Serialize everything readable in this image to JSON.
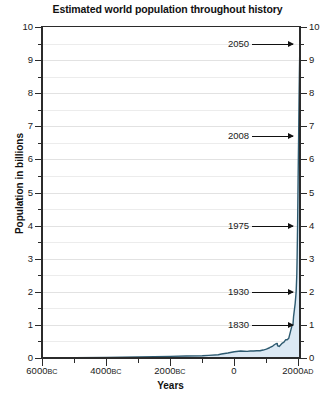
{
  "chart_data": {
    "type": "area",
    "title": "Estimated world population throughout history",
    "xlabel": "Years",
    "ylabel": "Population in billions",
    "xlim": [
      -6000,
      2050
    ],
    "ylim": [
      0,
      10
    ],
    "grid": true,
    "legend": "none",
    "y_ticks_major": [
      0,
      1,
      2,
      3,
      4,
      5,
      6,
      7,
      8,
      9,
      10
    ],
    "y_ticks_minor": [
      0.5,
      1.5,
      2.5,
      3.5,
      4.5,
      5.5,
      6.5,
      7.5,
      8.5,
      9.5
    ],
    "y_tick_labels": [
      "0",
      "1",
      "2",
      "3",
      "4",
      "5",
      "6",
      "7",
      "8",
      "9",
      "10"
    ],
    "x_ticks_major": [
      -6000,
      -4000,
      -2000,
      0,
      2000
    ],
    "x_ticks_minor": [
      -5000,
      -3000,
      -1000,
      1000
    ],
    "x_tick_labels": [
      {
        "value": -6000,
        "number": "6000",
        "era": "BC"
      },
      {
        "value": -4000,
        "number": "4000",
        "era": "BC"
      },
      {
        "value": -2000,
        "number": "2000",
        "era": "BC"
      },
      {
        "value": 0,
        "number": "0",
        "era": ""
      },
      {
        "value": 2000,
        "number": "2000",
        "era": "AD"
      }
    ],
    "line_color": "#2d5a70",
    "fill_color": "#dce9f4",
    "axis_color": "#2b2b2b",
    "grid_color": "#ececec",
    "series": [
      {
        "name": "World population",
        "x": [
          -6000,
          -5000,
          -4000,
          -3000,
          -2500,
          -2000,
          -1500,
          -1000,
          -800,
          -500,
          -400,
          -200,
          0,
          200,
          400,
          500,
          600,
          700,
          800,
          900,
          1000,
          1100,
          1200,
          1250,
          1300,
          1340,
          1350,
          1400,
          1500,
          1550,
          1600,
          1650,
          1700,
          1750,
          1800,
          1830,
          1850,
          1900,
          1930,
          1950,
          1960,
          1970,
          1975,
          1980,
          1990,
          2000,
          2008,
          2010,
          2020,
          2030,
          2040,
          2050
        ],
        "values": [
          0.005,
          0.01,
          0.02,
          0.03,
          0.04,
          0.05,
          0.06,
          0.07,
          0.08,
          0.1,
          0.12,
          0.15,
          0.19,
          0.21,
          0.2,
          0.21,
          0.21,
          0.22,
          0.22,
          0.24,
          0.27,
          0.31,
          0.36,
          0.4,
          0.43,
          0.44,
          0.37,
          0.35,
          0.45,
          0.48,
          0.55,
          0.55,
          0.6,
          0.79,
          0.98,
          1.0,
          1.26,
          1.65,
          2.0,
          2.52,
          3.02,
          3.7,
          4.0,
          4.44,
          5.32,
          6.14,
          6.7,
          6.92,
          7.79,
          8.5,
          9.1,
          9.5
        ]
      }
    ],
    "annotations": [
      {
        "label": "2050",
        "year": 2050,
        "population": 9.5
      },
      {
        "label": "2008",
        "year": 2008,
        "population": 6.7
      },
      {
        "label": "1975",
        "year": 1975,
        "population": 4.0
      },
      {
        "label": "1930",
        "year": 1930,
        "population": 2.0
      },
      {
        "label": "1830",
        "year": 1830,
        "population": 1.0
      }
    ]
  }
}
